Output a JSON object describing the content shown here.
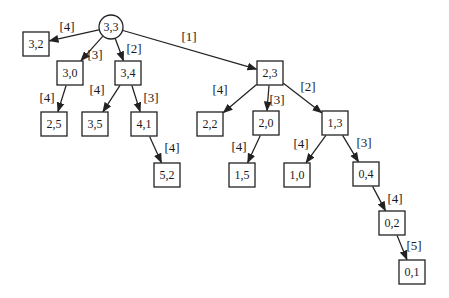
{
  "diagram": {
    "colors": {
      "background": "#ffffff",
      "stroke": "#222222",
      "text": "#1a1a1a"
    },
    "root_id": "3,3",
    "nodes": [
      {
        "id": "3,3",
        "label": "3,3",
        "shape": "circle",
        "x": 111,
        "y": 27
      },
      {
        "id": "3,2",
        "label": "3,2",
        "shape": "box",
        "x": 36,
        "y": 44
      },
      {
        "id": "3,0",
        "label": "3,0",
        "shape": "box",
        "x": 70,
        "y": 73
      },
      {
        "id": "3,4",
        "label": "3,4",
        "shape": "box",
        "x": 128,
        "y": 73
      },
      {
        "id": "2,3",
        "label": "2,3",
        "shape": "box",
        "x": 270,
        "y": 73
      },
      {
        "id": "2,5",
        "label": "2,5",
        "shape": "box",
        "x": 54,
        "y": 124
      },
      {
        "id": "3,5",
        "label": "3,5",
        "shape": "box",
        "x": 95,
        "y": 124
      },
      {
        "id": "4,1",
        "label": "4,1",
        "shape": "box",
        "x": 144,
        "y": 124
      },
      {
        "id": "2,2",
        "label": "2,2",
        "shape": "box",
        "x": 210,
        "y": 124
      },
      {
        "id": "2,0",
        "label": "2,0",
        "shape": "box",
        "x": 266,
        "y": 123
      },
      {
        "id": "1,3",
        "label": "1,3",
        "shape": "box",
        "x": 335,
        "y": 123
      },
      {
        "id": "5,2",
        "label": "5,2",
        "shape": "box",
        "x": 167,
        "y": 175
      },
      {
        "id": "1,5",
        "label": "1,5",
        "shape": "box",
        "x": 242,
        "y": 175
      },
      {
        "id": "1,0",
        "label": "1,0",
        "shape": "box",
        "x": 297,
        "y": 175
      },
      {
        "id": "0,4",
        "label": "0,4",
        "shape": "box",
        "x": 366,
        "y": 174
      },
      {
        "id": "0,2",
        "label": "0,2",
        "shape": "box",
        "x": 392,
        "y": 223
      },
      {
        "id": "0,1",
        "label": "0,1",
        "shape": "box",
        "x": 412,
        "y": 272
      }
    ],
    "edges": [
      {
        "from": "3,3",
        "to": "3,2",
        "label": "[4]",
        "lx": 67,
        "ly": 26
      },
      {
        "from": "3,3",
        "to": "3,0",
        "label": "[3]",
        "lx": 95,
        "ly": 54
      },
      {
        "from": "3,3",
        "to": "3,4",
        "label": "[2]",
        "lx": 134,
        "ly": 48
      },
      {
        "from": "3,3",
        "to": "2,3",
        "label": "[1]",
        "lx": 189,
        "ly": 36
      },
      {
        "from": "3,0",
        "to": "2,5",
        "label": "[4]",
        "lx": 47,
        "ly": 97
      },
      {
        "from": "3,4",
        "to": "3,5",
        "label": "[4]",
        "lx": 97,
        "ly": 89
      },
      {
        "from": "3,4",
        "to": "4,1",
        "label": "[3]",
        "lx": 151,
        "ly": 97
      },
      {
        "from": "4,1",
        "to": "5,2",
        "label": "[4]",
        "lx": 172,
        "ly": 147
      },
      {
        "from": "2,3",
        "to": "2,2",
        "label": "[4]",
        "lx": 220,
        "ly": 89
      },
      {
        "from": "2,3",
        "to": "2,0",
        "label": "[3]",
        "lx": 277,
        "ly": 99
      },
      {
        "from": "2,3",
        "to": "1,3",
        "label": "[2]",
        "lx": 308,
        "ly": 86
      },
      {
        "from": "2,0",
        "to": "1,5",
        "label": "[4]",
        "lx": 239,
        "ly": 146
      },
      {
        "from": "1,3",
        "to": "1,0",
        "label": "[4]",
        "lx": 301,
        "ly": 143
      },
      {
        "from": "1,3",
        "to": "0,4",
        "label": "[3]",
        "lx": 364,
        "ly": 142
      },
      {
        "from": "0,4",
        "to": "0,2",
        "label": "[4]",
        "lx": 395,
        "ly": 198
      },
      {
        "from": "0,2",
        "to": "0,1",
        "label": "[5]",
        "lx": 414,
        "ly": 245
      }
    ],
    "geometry": {
      "box_half_width": 13,
      "box_half_height": 12,
      "circle_radius": 12
    }
  }
}
